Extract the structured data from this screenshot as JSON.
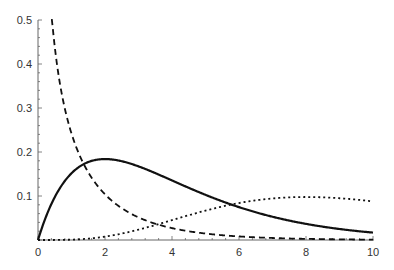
{
  "chart_data": {
    "type": "line",
    "title": "",
    "xlabel": "",
    "ylabel": "",
    "xlim": [
      0,
      10
    ],
    "ylim": [
      0,
      0.5
    ],
    "grid": false,
    "legend": null,
    "x_ticks": [
      0,
      2,
      4,
      6,
      8,
      10
    ],
    "x_tick_labels": [
      "0",
      "2",
      "4",
      "6",
      "8",
      "10"
    ],
    "y_ticks": [
      0.1,
      0.2,
      0.3,
      0.4,
      0.5
    ],
    "y_tick_labels": [
      "0.1",
      "0.2",
      "0.3",
      "0.4",
      "0.5"
    ],
    "x": [
      0.4,
      0.5,
      0.75,
      1,
      1.5,
      2,
      2.5,
      3,
      4,
      5,
      6,
      7,
      8,
      9,
      10
    ],
    "series": [
      {
        "name": "solid curve (chi-squared k=4)",
        "style": "solid",
        "values": [
          0.082,
          0.097,
          0.129,
          0.152,
          0.177,
          0.184,
          0.179,
          0.167,
          0.135,
          0.103,
          0.075,
          0.053,
          0.037,
          0.025,
          0.017
        ]
      },
      {
        "name": "dashed curve (chi-squared k=1)",
        "style": "dashed",
        "values": [
          0.516,
          0.439,
          0.318,
          0.242,
          0.154,
          0.104,
          0.073,
          0.051,
          0.027,
          0.015,
          0.008,
          0.004,
          0.002,
          0.001,
          0.001
        ]
      },
      {
        "name": "dotted curve (chi-squared k=10)",
        "style": "dotted",
        "values": [
          0.0,
          0.0,
          0.0002,
          0.0008,
          0.0046,
          0.0153,
          0.0357,
          0.0668,
          0.0451,
          0.0668,
          0.0839,
          0.0941,
          0.0977,
          0.0958,
          0.0877
        ]
      }
    ],
    "colors": {
      "curve": "#111111",
      "axis": "#666666",
      "text": "#333333"
    }
  }
}
